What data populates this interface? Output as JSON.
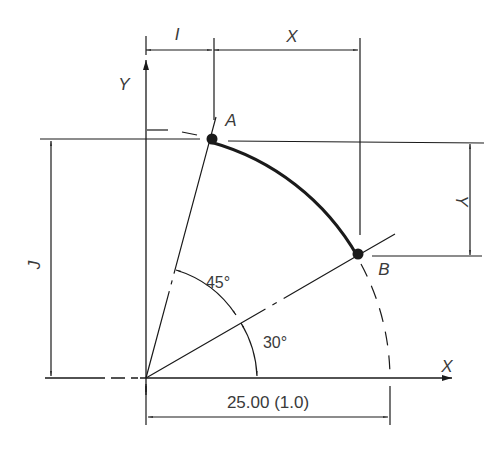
{
  "diagram": {
    "points": {
      "A": {
        "label": "A",
        "angle_deg": 75
      },
      "B": {
        "label": "B",
        "angle_deg": 30
      }
    },
    "axes": {
      "x_label": "X",
      "y_label": "Y"
    },
    "dimensions": {
      "I": "I",
      "X": "X",
      "J": "J",
      "Y": "Y",
      "radius": "25.00 (1.0)"
    },
    "angles": {
      "a45": "45°",
      "a30": "30°"
    },
    "colors": {
      "line": "#1a1a1a",
      "text": "#3a3a3a",
      "background": "#ffffff"
    }
  }
}
